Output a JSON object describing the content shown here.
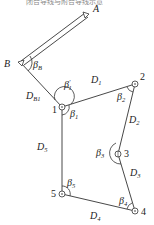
{
  "header": {
    "cut_text": "闭合导线与附合导线示意"
  },
  "control_points": [
    {
      "id": "A",
      "label": "A"
    },
    {
      "id": "B",
      "label": "B"
    }
  ],
  "stations": [
    {
      "id": "1",
      "label": "1"
    },
    {
      "id": "2",
      "label": "2"
    },
    {
      "id": "3",
      "label": "3"
    },
    {
      "id": "4",
      "label": "4"
    },
    {
      "id": "5",
      "label": "5"
    }
  ],
  "distances": [
    {
      "id": "DB1",
      "base": "D",
      "sub": "B1"
    },
    {
      "id": "D1",
      "base": "D",
      "sub": "1"
    },
    {
      "id": "D2",
      "base": "D",
      "sub": "2"
    },
    {
      "id": "D3",
      "base": "D",
      "sub": "3"
    },
    {
      "id": "D4",
      "base": "D",
      "sub": "4"
    },
    {
      "id": "D5",
      "base": "D",
      "sub": "5"
    }
  ],
  "angles": [
    {
      "id": "betaB",
      "base": "β",
      "sub": "B",
      "prime": ""
    },
    {
      "id": "beta1p",
      "base": "β",
      "sub": "1",
      "prime": "′"
    },
    {
      "id": "beta1",
      "base": "β",
      "sub": "1",
      "prime": ""
    },
    {
      "id": "beta2",
      "base": "β",
      "sub": "2",
      "prime": ""
    },
    {
      "id": "beta3",
      "base": "β",
      "sub": "3",
      "prime": ""
    },
    {
      "id": "beta4",
      "base": "β",
      "sub": "4",
      "prime": ""
    },
    {
      "id": "beta5",
      "base": "β",
      "sub": "5",
      "prime": ""
    }
  ]
}
